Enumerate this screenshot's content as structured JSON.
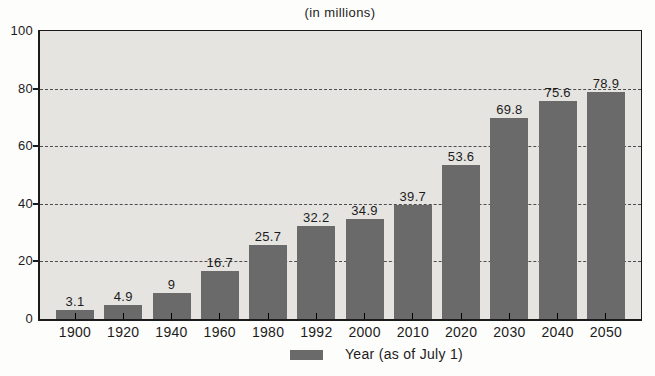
{
  "chart_data": {
    "type": "bar",
    "title": "(in millions)",
    "categories": [
      "1900",
      "1920",
      "1940",
      "1960",
      "1980",
      "1992",
      "2000",
      "2010",
      "2020",
      "2030",
      "2040",
      "2050"
    ],
    "values": [
      3.1,
      4.9,
      9,
      16.7,
      25.7,
      32.2,
      34.9,
      39.7,
      53.6,
      69.8,
      75.6,
      78.9
    ],
    "value_labels": [
      "3.1",
      "4.9",
      "9",
      "16.7",
      "25.7",
      "32.2",
      "34.9",
      "39.7",
      "53.6",
      "69.8",
      "75.6",
      "78.9"
    ],
    "xlabel": "",
    "ylabel": "",
    "ylim": [
      0,
      100
    ],
    "yticks": [
      0,
      20,
      40,
      60,
      80,
      100
    ],
    "gridline_values": [
      20,
      40,
      60,
      80
    ],
    "grid": "horizontal-dashed",
    "legend": {
      "label": "Year (as of July 1)",
      "position": "bottom-center",
      "swatch": "bar-color"
    },
    "colors": {
      "bar": "#6a6a6a",
      "plot_background": "#e5e4e1",
      "axis": "#1b1b1b",
      "gridline": "#4d4d4d",
      "text": "#1c1c1c",
      "page_background": "#fdfdfb"
    }
  }
}
